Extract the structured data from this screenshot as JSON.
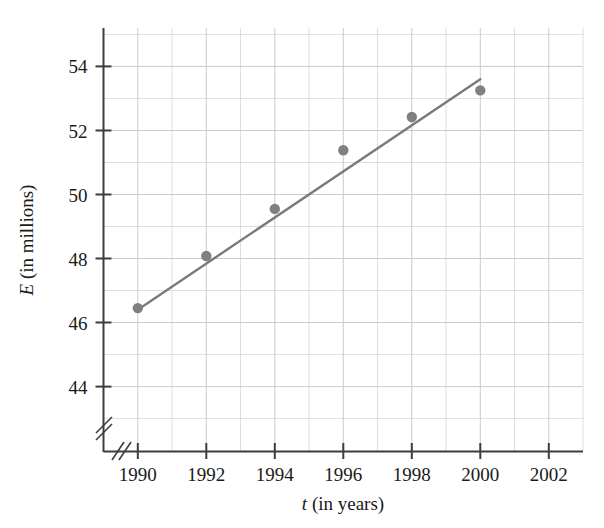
{
  "chart_data": {
    "type": "scatter",
    "title": "",
    "xlabel": "t (in years)",
    "ylabel": "E (in millions)",
    "xlabel_italic_symbol": "t",
    "xlabel_rest": " (in years)",
    "ylabel_italic_symbol": "E",
    "ylabel_rest": " (in millions)",
    "x": [
      1990,
      1992,
      1994,
      1996,
      1998,
      2000
    ],
    "values": [
      46.45,
      48.08,
      49.55,
      51.38,
      52.42,
      53.25
    ],
    "series": [
      {
        "name": "data points",
        "x": [
          1990,
          1992,
          1994,
          1996,
          1998,
          2000
        ],
        "values": [
          46.45,
          48.08,
          49.55,
          51.38,
          52.42,
          53.25
        ]
      },
      {
        "name": "line of best fit",
        "x": [
          1990,
          2000
        ],
        "values": [
          46.4,
          53.6
        ]
      }
    ],
    "xticks": [
      1990,
      1992,
      1994,
      1996,
      1998,
      2002
    ],
    "xtick_labels": [
      "1990",
      "1992",
      "1994",
      "1996",
      "1998",
      "2000",
      "2002"
    ],
    "xtick_values": [
      1990,
      1992,
      1994,
      1996,
      1998,
      2000,
      2002
    ],
    "ytick_labels": [
      "44",
      "46",
      "48",
      "50",
      "52",
      "54"
    ],
    "ytick_values": [
      44,
      46,
      48,
      50,
      52,
      54
    ],
    "xlim": [
      1989,
      2003
    ],
    "ylim": [
      42.8,
      55.2
    ],
    "x_minor_step": 1,
    "y_minor_step": 1,
    "grid": true,
    "legend": "none",
    "axis_break_x": true,
    "axis_break_y": true,
    "point_color": "#808080",
    "line_color": "#7a7a7a",
    "grid_color": "#c9c9c9",
    "axis_color": "#3d3d3d"
  }
}
